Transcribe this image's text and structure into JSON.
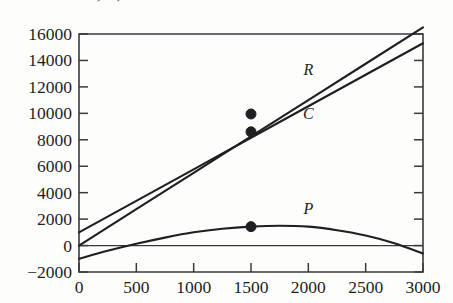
{
  "figure": {
    "title_fragment": "R, C, and P",
    "background_color": "#fdfdfc",
    "ink_color": "#1f1f22"
  },
  "chart_data": {
    "type": "line",
    "title": "",
    "xlabel": "",
    "ylabel": "",
    "xlim": [
      0,
      3000
    ],
    "ylim": [
      -2000,
      16000
    ],
    "grid": false,
    "legend": "inline-curve-labels",
    "x_ticks": [
      0,
      500,
      1000,
      1500,
      2000,
      2500,
      3000
    ],
    "x_tick_labels": [
      "0",
      "500",
      "1000",
      "1500",
      "2000",
      "2500",
      "3000"
    ],
    "y_ticks": [
      -2000,
      0,
      2000,
      4000,
      6000,
      8000,
      10000,
      12000,
      14000,
      16000
    ],
    "y_tick_labels": [
      "−2000",
      "0",
      "2000",
      "4000",
      "6000",
      "8000",
      "10000",
      "12000",
      "14000",
      "16000"
    ],
    "zero_reference_line": 0,
    "series": [
      {
        "name": "R",
        "label": "R",
        "label_x": 2000,
        "label_y": 12900,
        "kind": "line",
        "x": [
          0,
          500,
          1000,
          1500,
          2000,
          2500,
          3000
        ],
        "values": [
          0,
          2750,
          5500,
          8250,
          11000,
          13750,
          16500
        ],
        "marker_points": [
          {
            "x": 1500,
            "y": 9950
          }
        ]
      },
      {
        "name": "C",
        "label": "C",
        "label_x": 2000,
        "label_y": 9600,
        "kind": "line",
        "x": [
          0,
          500,
          1000,
          1500,
          2000,
          2500,
          3000
        ],
        "values": [
          1000,
          3383,
          5767,
          8150,
          10533,
          12917,
          15300
        ],
        "marker_points": [
          {
            "x": 1500,
            "y": 8600
          }
        ]
      },
      {
        "name": "P",
        "label": "P",
        "label_x": 2000,
        "label_y": 2350,
        "kind": "quadratic",
        "x": [
          0,
          250,
          500,
          750,
          1000,
          1250,
          1500,
          1750,
          2000,
          2250,
          2500,
          2750,
          3000
        ],
        "values": [
          -1000,
          -400,
          130,
          600,
          1000,
          1270,
          1430,
          1500,
          1430,
          1160,
          760,
          180,
          -600
        ],
        "marker_points": [
          {
            "x": 1500,
            "y": 1430
          }
        ]
      }
    ],
    "annotations": [
      {
        "text": "R",
        "x": 2000,
        "y": 12900
      },
      {
        "text": "C",
        "x": 2000,
        "y": 9600
      },
      {
        "text": "P",
        "x": 2000,
        "y": 2350
      }
    ]
  }
}
